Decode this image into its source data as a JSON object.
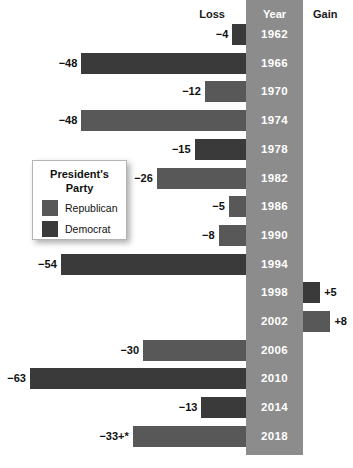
{
  "headers": {
    "loss": "Loss",
    "year": "Year",
    "gain": "Gain"
  },
  "legend": {
    "title_line1": "President's",
    "title_line2": "Party",
    "items": [
      {
        "label": "Republican",
        "party": "rep",
        "color": "#585858"
      },
      {
        "label": "Democrat",
        "party": "dem",
        "color": "#3a3a3a"
      }
    ]
  },
  "colors": {
    "republican": "#585858",
    "democrat": "#3a3a3a",
    "year_band": "#8c8c8c",
    "background": "#ffffff",
    "text": "#111111"
  },
  "chart_data": {
    "type": "bar",
    "orientation": "horizontal-diverging",
    "title": "",
    "xlabel": "",
    "ylabel": "Year",
    "legend_position": "left-middle",
    "grid": false,
    "categories": [
      "1962",
      "1966",
      "1970",
      "1974",
      "1978",
      "1982",
      "1986",
      "1990",
      "1994",
      "1998",
      "2002",
      "2006",
      "2010",
      "2014",
      "2018"
    ],
    "values": [
      -4,
      -48,
      -12,
      -48,
      -15,
      -26,
      -5,
      -8,
      -54,
      5,
      8,
      -30,
      -63,
      -13,
      -33
    ],
    "labels": [
      "−4",
      "−48",
      "−12",
      "−48",
      "−15",
      "−26",
      "−5",
      "−8",
      "−54",
      "+5",
      "+8",
      "−30",
      "−63",
      "−13",
      "−33+*"
    ],
    "parties": [
      "dem",
      "dem",
      "rep",
      "rep",
      "dem",
      "rep",
      "rep",
      "rep",
      "dem",
      "dem",
      "rep",
      "rep",
      "dem",
      "dem",
      "rep"
    ],
    "side": [
      "loss",
      "loss",
      "loss",
      "loss",
      "loss",
      "loss",
      "loss",
      "loss",
      "loss",
      "gain",
      "gain",
      "loss",
      "loss",
      "loss",
      "loss"
    ],
    "xlim": [
      -63,
      8
    ]
  },
  "rows": [
    {
      "year": "1962",
      "label": "−4",
      "value": -4,
      "party": "dem",
      "side": "loss"
    },
    {
      "year": "1966",
      "label": "−48",
      "value": -48,
      "party": "dem",
      "side": "loss"
    },
    {
      "year": "1970",
      "label": "−12",
      "value": -12,
      "party": "rep",
      "side": "loss"
    },
    {
      "year": "1974",
      "label": "−48",
      "value": -48,
      "party": "rep",
      "side": "loss"
    },
    {
      "year": "1978",
      "label": "−15",
      "value": -15,
      "party": "dem",
      "side": "loss"
    },
    {
      "year": "1982",
      "label": "−26",
      "value": -26,
      "party": "rep",
      "side": "loss"
    },
    {
      "year": "1986",
      "label": "−5",
      "value": -5,
      "party": "rep",
      "side": "loss"
    },
    {
      "year": "1990",
      "label": "−8",
      "value": -8,
      "party": "rep",
      "side": "loss"
    },
    {
      "year": "1994",
      "label": "−54",
      "value": -54,
      "party": "dem",
      "side": "loss"
    },
    {
      "year": "1998",
      "label": "+5",
      "value": 5,
      "party": "dem",
      "side": "gain"
    },
    {
      "year": "2002",
      "label": "+8",
      "value": 8,
      "party": "rep",
      "side": "gain"
    },
    {
      "year": "2006",
      "label": "−30",
      "value": -30,
      "party": "rep",
      "side": "loss"
    },
    {
      "year": "2010",
      "label": "−63",
      "value": -63,
      "party": "dem",
      "side": "loss"
    },
    {
      "year": "2014",
      "label": "−13",
      "value": -13,
      "party": "dem",
      "side": "loss"
    },
    {
      "year": "2018",
      "label": "−33+*",
      "value": -33,
      "party": "rep",
      "side": "loss"
    }
  ]
}
